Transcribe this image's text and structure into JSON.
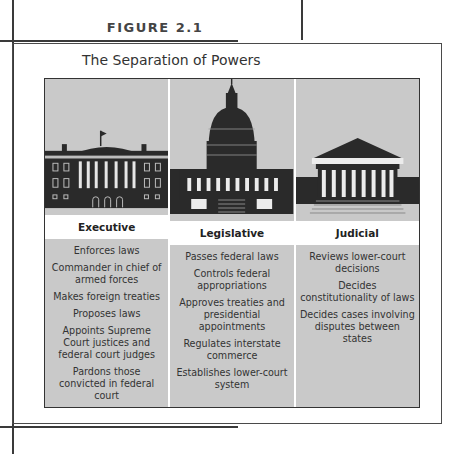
{
  "figure_label": "FIGURE 2.1",
  "title": "The Separation of Powers",
  "branches": [
    {
      "name": "Executive",
      "icon": "white-house-icon",
      "powers": [
        "Enforces laws",
        "Commander in chief of armed forces",
        "Makes foreign treaties",
        "Proposes laws",
        "Appoints Supreme Court justices and federal court judges",
        "Pardons those convicted in federal court"
      ]
    },
    {
      "name": "Legislative",
      "icon": "capitol-building-icon",
      "powers": [
        "Passes federal laws",
        "Controls federal appropriations",
        "Approves treaties and presidential appointments",
        "Regulates interstate commerce",
        "Establishes lower-court system"
      ]
    },
    {
      "name": "Judicial",
      "icon": "supreme-court-icon",
      "powers": [
        "Reviews lower-court decisions",
        "Decides constitutionality of laws",
        "Decides cases involving disputes between states"
      ]
    }
  ],
  "colors": {
    "panel": "#c9c9c9",
    "building": "#2a2a2a",
    "header": "#ffffff"
  }
}
